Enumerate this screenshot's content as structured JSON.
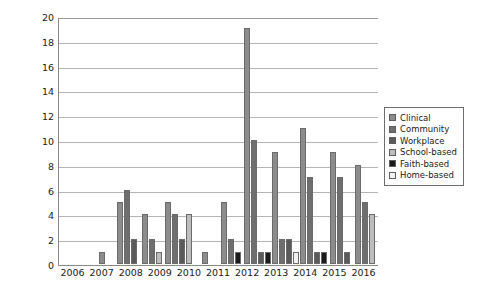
{
  "chart_data": {
    "type": "bar",
    "title": "",
    "xlabel": "",
    "ylabel": "",
    "ylim": [
      0,
      20
    ],
    "ytick_step": 2,
    "yticks": [
      0,
      2,
      4,
      6,
      8,
      10,
      12,
      14,
      16,
      18,
      20
    ],
    "grid": "horizontal",
    "legend_position": "right",
    "categories": [
      "2006",
      "2007",
      "2008",
      "2009",
      "2010",
      "2011",
      "2012",
      "2013",
      "2014",
      "2015",
      "2016"
    ],
    "series": [
      {
        "name": "Clinical",
        "color": "#8c8c8c",
        "values": [
          1,
          5,
          4,
          5,
          1,
          5,
          19,
          9,
          11,
          9,
          8
        ]
      },
      {
        "name": "Community",
        "color": "#6e6e6e",
        "values": [
          0,
          6,
          2,
          4,
          0,
          2,
          10,
          2,
          7,
          7,
          5
        ]
      },
      {
        "name": "Workplace",
        "color": "#5a5a5a",
        "values": [
          0,
          2,
          0,
          2,
          0,
          0,
          1,
          2,
          1,
          1,
          0
        ]
      },
      {
        "name": "School-based",
        "color": "#bdbdbd",
        "values": [
          0,
          0,
          1,
          4,
          0,
          0,
          0,
          0,
          0,
          0,
          4
        ]
      },
      {
        "name": "Faith-based",
        "color": "#1a1a1a",
        "values": [
          0,
          0,
          0,
          0,
          0,
          1,
          1,
          0,
          1,
          0,
          0
        ]
      },
      {
        "name": "Home-based",
        "color": "#f2f2f2",
        "values": [
          0,
          0,
          0,
          0,
          0,
          0,
          0,
          1,
          0,
          0,
          0
        ]
      }
    ]
  },
  "legend": {
    "items": [
      {
        "label": "Clinical"
      },
      {
        "label": "Community"
      },
      {
        "label": "Workplace"
      },
      {
        "label": "School-based"
      },
      {
        "label": "Faith-based"
      },
      {
        "label": "Home-based"
      }
    ]
  },
  "caption": {
    "text": ""
  }
}
